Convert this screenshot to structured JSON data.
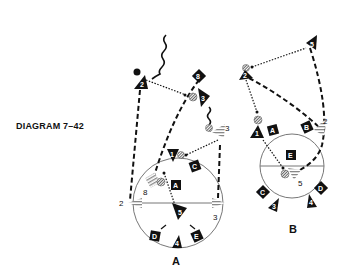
{
  "title": "DIAGRAM 7–42",
  "colors": {
    "ink": "#111111",
    "paper": "#ffffff",
    "court": "#777777"
  },
  "panels": [
    {
      "label": "A",
      "offense_players": [
        "1",
        "2",
        "3",
        "4",
        "5",
        "8"
      ],
      "defense_players": [
        "A",
        "B",
        "C",
        "D",
        "E"
      ],
      "screen_markers": [
        "2",
        "3",
        "8",
        "3"
      ]
    },
    {
      "label": "B",
      "offense_players": [
        "1",
        "2",
        "3",
        "4",
        "5"
      ],
      "defense_players": [
        "A",
        "B",
        "C",
        "D",
        "E"
      ],
      "screen_markers": [
        "2",
        "5"
      ]
    }
  ],
  "legend": {
    "dashed_line": "player movement",
    "dotted_line": "pass",
    "wavy_line": "dribble",
    "striped_ball": "ball",
    "triangle": "offense player",
    "square": "defense player",
    "hatched_fan": "screen"
  }
}
